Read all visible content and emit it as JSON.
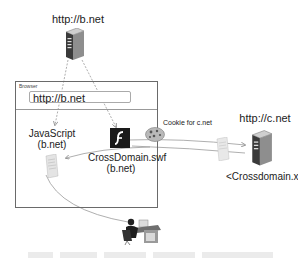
{
  "diagram": {
    "nodes": {
      "server_b": {
        "label": "http://b.net",
        "icon": "server-icon"
      },
      "server_c": {
        "label": "http://c.net",
        "icon": "server-icon"
      },
      "browser": {
        "title": "Browser",
        "address": "http://b.net"
      },
      "javascript": {
        "line1": "JavaScript",
        "line2": "(b.net)",
        "icon": "document-icon"
      },
      "flash_swf": {
        "line1": "CrossDomain.swf",
        "line2": "(b.net)",
        "icon": "flash-icon"
      },
      "cookie": {
        "label": "Cookie for c.net",
        "icon": "cookie-icon"
      },
      "crossdomain_file": {
        "label": "<Crossdomain.xml>",
        "icon": "document-icon"
      },
      "user": {
        "icon": "user-at-desk-icon"
      }
    },
    "edges": [
      {
        "from": "server_b",
        "to": "javascript",
        "style": "dashed"
      },
      {
        "from": "server_b",
        "to": "flash_swf",
        "style": "dashed"
      },
      {
        "from": "flash_swf",
        "to": "server_c",
        "style": "solid",
        "via": "cookie"
      },
      {
        "from": "server_c",
        "to": "flash_swf",
        "style": "solid"
      },
      {
        "from": "flash_swf",
        "to": "javascript",
        "style": "solid"
      },
      {
        "from": "javascript",
        "to": "user",
        "style": "solid"
      }
    ],
    "colors": {
      "line": "#8a8a8a",
      "box": "#6a6a6a",
      "flash_bg": "#1a1a1a"
    }
  }
}
